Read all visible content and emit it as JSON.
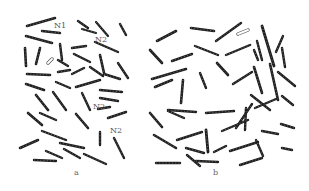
{
  "figure": {
    "panels": [
      {
        "id": "a",
        "label": "a",
        "label_pos": [
          74,
          169
        ]
      },
      {
        "id": "b",
        "label": "b",
        "label_pos": [
          213,
          169
        ]
      }
    ],
    "annotations": [
      {
        "text": "N1",
        "pos": [
          54,
          22
        ]
      },
      {
        "text": "N2",
        "pos": [
          95,
          36
        ]
      },
      {
        "text": "N2",
        "pos": [
          93,
          103
        ]
      },
      {
        "text": "N2",
        "pos": [
          110,
          127
        ]
      }
    ],
    "chromosomes": [
      [
        27,
        26,
        55,
        18,
        2.6
      ],
      [
        42,
        31,
        60,
        33,
        2.4
      ],
      [
        78,
        21,
        88,
        28,
        2.4
      ],
      [
        82,
        29,
        96,
        33,
        2.2
      ],
      [
        96,
        22,
        108,
        36,
        2.2
      ],
      [
        120,
        24,
        126,
        35,
        2.4
      ],
      [
        26,
        36,
        52,
        43,
        2.6
      ],
      [
        95,
        42,
        118,
        52,
        2.4
      ],
      [
        25,
        48,
        26,
        66,
        2.6
      ],
      [
        40,
        48,
        36,
        64,
        2.6
      ],
      [
        60,
        44,
        62,
        60,
        2.4
      ],
      [
        58,
        60,
        68,
        66,
        2.4
      ],
      [
        72,
        48,
        86,
        46,
        2.4
      ],
      [
        74,
        54,
        90,
        62,
        2.4
      ],
      [
        100,
        55,
        104,
        73,
        2.6
      ],
      [
        118,
        63,
        128,
        78,
        2.4
      ],
      [
        27,
        74,
        50,
        75,
        2.6
      ],
      [
        58,
        72,
        70,
        70,
        2.4
      ],
      [
        72,
        74,
        84,
        68,
        2.4
      ],
      [
        90,
        67,
        103,
        76,
        2.4
      ],
      [
        104,
        74,
        120,
        79,
        2.4
      ],
      [
        26,
        84,
        44,
        90,
        2.6
      ],
      [
        56,
        82,
        70,
        88,
        2.4
      ],
      [
        76,
        87,
        100,
        80,
        2.6
      ],
      [
        100,
        90,
        122,
        92,
        2.4
      ],
      [
        100,
        98,
        118,
        101,
        2.4
      ],
      [
        36,
        95,
        48,
        110,
        2.6
      ],
      [
        53,
        92,
        66,
        110,
        2.4
      ],
      [
        82,
        93,
        90,
        110,
        2.4
      ],
      [
        28,
        113,
        42,
        125,
        2.6
      ],
      [
        40,
        113,
        56,
        120,
        2.4
      ],
      [
        76,
        114,
        88,
        128,
        2.6
      ],
      [
        98,
        109,
        110,
        107,
        2.4
      ],
      [
        108,
        118,
        126,
        112,
        2.4
      ],
      [
        42,
        131,
        66,
        140,
        2.4
      ],
      [
        60,
        143,
        84,
        148,
        2.4
      ],
      [
        100,
        132,
        100,
        145,
        2.4
      ],
      [
        114,
        138,
        124,
        158,
        2.4
      ],
      [
        20,
        148,
        38,
        140,
        2.6
      ],
      [
        46,
        151,
        62,
        158,
        2.4
      ],
      [
        64,
        149,
        80,
        158,
        2.4
      ],
      [
        84,
        154,
        106,
        164,
        2.4
      ],
      [
        34,
        160,
        56,
        161,
        2.4
      ],
      [
        157,
        41,
        176,
        31,
        2.6
      ],
      [
        191,
        28,
        214,
        31,
        2.6
      ],
      [
        216,
        41,
        241,
        23,
        2.4
      ],
      [
        262,
        26,
        274,
        66,
        2.8
      ],
      [
        276,
        52,
        283,
        36,
        2.4
      ],
      [
        282,
        48,
        285,
        67,
        2.4
      ],
      [
        150,
        50,
        162,
        63,
        2.6
      ],
      [
        172,
        61,
        192,
        54,
        2.4
      ],
      [
        195,
        46,
        218,
        55,
        2.4
      ],
      [
        226,
        55,
        250,
        45,
        2.4
      ],
      [
        254,
        50,
        258,
        60,
        2.4
      ],
      [
        257,
        41,
        262,
        60,
        2.4
      ],
      [
        152,
        79,
        186,
        69,
        2.6
      ],
      [
        217,
        63,
        228,
        75,
        2.6
      ],
      [
        233,
        84,
        252,
        72,
        2.4
      ],
      [
        254,
        67,
        262,
        93,
        2.6
      ],
      [
        270,
        64,
        278,
        100,
        2.6
      ],
      [
        278,
        72,
        295,
        86,
        2.4
      ],
      [
        155,
        87,
        172,
        80,
        2.6
      ],
      [
        183,
        80,
        181,
        103,
        2.6
      ],
      [
        200,
        73,
        206,
        88,
        2.4
      ],
      [
        251,
        95,
        270,
        110,
        2.4
      ],
      [
        282,
        96,
        293,
        105,
        2.4
      ],
      [
        150,
        113,
        162,
        127,
        2.6
      ],
      [
        168,
        110,
        196,
        112,
        2.4
      ],
      [
        206,
        113,
        234,
        111,
        2.4
      ],
      [
        246,
        108,
        245,
        130,
        2.4
      ],
      [
        255,
        108,
        276,
        99,
        2.4
      ],
      [
        236,
        128,
        252,
        104,
        2.4
      ],
      [
        168,
        111,
        184,
        118,
        2.4
      ],
      [
        154,
        135,
        176,
        148,
        2.6
      ],
      [
        177,
        140,
        202,
        132,
        2.4
      ],
      [
        206,
        130,
        208,
        152,
        2.8
      ],
      [
        222,
        131,
        248,
        120,
        2.4
      ],
      [
        262,
        131,
        278,
        134,
        2.4
      ],
      [
        281,
        124,
        294,
        128,
        2.4
      ],
      [
        156,
        163,
        180,
        163,
        2.4
      ],
      [
        186,
        148,
        204,
        153,
        2.4
      ],
      [
        187,
        155,
        200,
        166,
        2.4
      ],
      [
        214,
        152,
        226,
        146,
        2.4
      ],
      [
        230,
        151,
        258,
        142,
        2.4
      ],
      [
        256,
        140,
        263,
        156,
        2.4
      ],
      [
        240,
        165,
        262,
        158,
        2.4
      ],
      [
        196,
        161,
        218,
        162,
        2.4
      ],
      [
        282,
        148,
        292,
        150,
        2.4
      ]
    ],
    "open_chromosomes": [
      [
        48,
        63,
        52,
        59
      ],
      [
        238,
        34,
        248,
        30
      ]
    ]
  }
}
